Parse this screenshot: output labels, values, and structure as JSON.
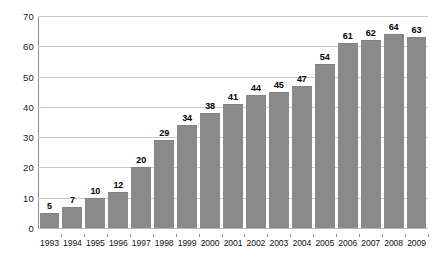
{
  "chart_data": {
    "type": "bar",
    "title": "",
    "subtitle": "",
    "xlabel": "",
    "ylabel": "",
    "categories": [
      "1993",
      "1994",
      "1995",
      "1996",
      "1997",
      "1998",
      "1999",
      "2000",
      "2001",
      "2002",
      "2003",
      "2004",
      "2005",
      "2006",
      "2007",
      "2008",
      "2009"
    ],
    "values": [
      5,
      7,
      10,
      12,
      20,
      29,
      34,
      38,
      41,
      44,
      45,
      47,
      54,
      61,
      62,
      64,
      63
    ],
    "value_labels": [
      "5",
      "7",
      "10",
      "12",
      "20",
      "29",
      "34",
      "38",
      "41",
      "44",
      "45",
      "47",
      "54",
      "61",
      "62",
      "64",
      "63"
    ],
    "ylim": [
      0,
      70
    ],
    "ytick_values": [
      0,
      10,
      20,
      30,
      40,
      50,
      60,
      70
    ],
    "ytick_labels": [
      "0",
      "10",
      "20",
      "30",
      "40",
      "50",
      "60",
      "70"
    ],
    "grid": true,
    "legend": null,
    "legend_position": "none",
    "bar_color": "#8a8a8a",
    "gridline_color": "#c9c9c9",
    "axis_color": "#8f8f8f",
    "label_color": "#000000",
    "background_color": "#ffffff",
    "data_labels_shown": true,
    "series": [
      {
        "name": "",
        "values": [
          5,
          7,
          10,
          12,
          20,
          29,
          34,
          38,
          41,
          44,
          45,
          47,
          54,
          61,
          62,
          64,
          63
        ]
      }
    ]
  }
}
